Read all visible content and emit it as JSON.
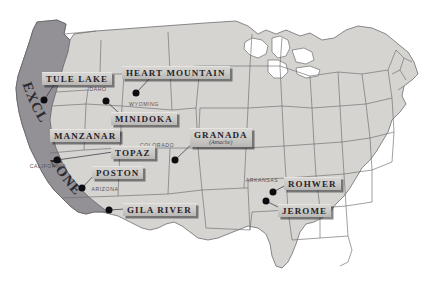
{
  "map": {
    "title": "Japanese American Incarceration Camps and the West Coast Exclusion Zone",
    "colors": {
      "land": "#d5d4d0",
      "land_stroke": "#6e6c70",
      "exclusion_zone": "#8f8d91",
      "water": "#ffffff",
      "marker": "#0d0c10",
      "plate_face": "#cdcbc7",
      "plate_text": "#25232a",
      "state_text": "#55535a",
      "background": "#ffffff"
    },
    "exclusion_zone": {
      "label": "EXCLUSION ZONE",
      "word_one": "EXCLUSION",
      "word_two": "ZONE"
    },
    "camps": [
      {
        "id": "tule-lake",
        "name": "TULE LAKE",
        "sub": "",
        "plate_x": 42,
        "plate_y": 72,
        "dot_x": 44,
        "dot_y": 100
      },
      {
        "id": "heart-mountain",
        "name": "HEART MOUNTAIN",
        "sub": "",
        "plate_x": 122,
        "plate_y": 66,
        "dot_x": 136,
        "dot_y": 93
      },
      {
        "id": "minidoka",
        "name": "MINIDOKA",
        "sub": "",
        "plate_x": 111,
        "plate_y": 112,
        "dot_x": 106,
        "dot_y": 101
      },
      {
        "id": "manzanar",
        "name": "MANZANAR",
        "sub": "",
        "plate_x": 50,
        "plate_y": 129,
        "dot_x": 101,
        "dot_y": 136
      },
      {
        "id": "topaz",
        "name": "TOPAZ",
        "sub": "",
        "plate_x": 111,
        "plate_y": 146,
        "dot_x": 57,
        "dot_y": 160
      },
      {
        "id": "granada",
        "name": "GRANADA",
        "sub": "(Amache)",
        "plate_x": 190,
        "plate_y": 128,
        "dot_x": 175,
        "dot_y": 160
      },
      {
        "id": "poston",
        "name": "POSTON",
        "sub": "",
        "plate_x": 92,
        "plate_y": 166,
        "dot_x": 82,
        "dot_y": 188
      },
      {
        "id": "gila-river",
        "name": "GILA RIVER",
        "sub": "",
        "plate_x": 123,
        "plate_y": 203,
        "dot_x": 109,
        "dot_y": 210
      },
      {
        "id": "rohwer",
        "name": "ROHWER",
        "sub": "",
        "plate_x": 284,
        "plate_y": 177,
        "dot_x": 273,
        "dot_y": 192
      },
      {
        "id": "jerome",
        "name": "JEROME",
        "sub": "",
        "plate_x": 278,
        "plate_y": 204,
        "dot_x": 266,
        "dot_y": 201
      }
    ],
    "states": [
      {
        "id": "idaho",
        "name": "IDAHO",
        "x": 97,
        "y": 89
      },
      {
        "id": "wyoming",
        "name": "WYOMING",
        "x": 144,
        "y": 104
      },
      {
        "id": "utah",
        "name": "UTAH",
        "x": 114,
        "y": 135
      },
      {
        "id": "colorado",
        "name": "COLORADO",
        "x": 157,
        "y": 145
      },
      {
        "id": "california",
        "name": "CALIFORNIA",
        "x": 48,
        "y": 166
      },
      {
        "id": "arizona",
        "name": "ARIZONA",
        "x": 105,
        "y": 189
      },
      {
        "id": "arkansas",
        "name": "ARKANSAS",
        "x": 262,
        "y": 180
      }
    ]
  }
}
